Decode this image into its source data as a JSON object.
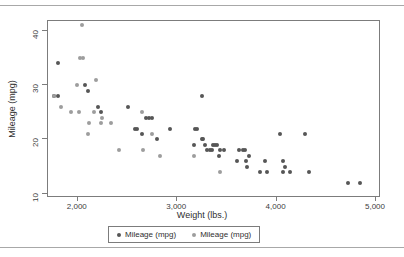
{
  "chart_data": {
    "type": "scatter",
    "title": "",
    "xlabel": "Weight (lbs.)",
    "ylabel": "Mileage (mpg)",
    "xlim": [
      1700,
      5050
    ],
    "ylim": [
      9.2,
      41.8
    ],
    "xticks": [
      2000,
      3000,
      4000,
      5000
    ],
    "xtick_labels": [
      "2,000",
      "3,000",
      "4,000",
      "5,000"
    ],
    "yticks": [
      10,
      20,
      30,
      40
    ],
    "ytick_labels": [
      "10",
      "20",
      "30",
      "40"
    ],
    "grid": false,
    "legend_position": "bottom-center",
    "series": [
      {
        "name": "Mileage (mpg)",
        "color": "#565656",
        "points": [
          [
            1800,
            34
          ],
          [
            1760,
            28
          ],
          [
            1800,
            28
          ],
          [
            2070,
            30
          ],
          [
            2100,
            29
          ],
          [
            2200,
            26
          ],
          [
            2230,
            25
          ],
          [
            2500,
            26
          ],
          [
            2580,
            22
          ],
          [
            2600,
            22
          ],
          [
            2650,
            21
          ],
          [
            2690,
            24
          ],
          [
            2720,
            24
          ],
          [
            2750,
            24
          ],
          [
            2800,
            20
          ],
          [
            2930,
            22
          ],
          [
            3180,
            22
          ],
          [
            3200,
            22
          ],
          [
            3170,
            19
          ],
          [
            3250,
            28
          ],
          [
            3250,
            20
          ],
          [
            3260,
            20
          ],
          [
            3280,
            19
          ],
          [
            3300,
            18
          ],
          [
            3330,
            18
          ],
          [
            3350,
            18
          ],
          [
            3360,
            19
          ],
          [
            3380,
            19
          ],
          [
            3400,
            19
          ],
          [
            3420,
            17
          ],
          [
            3430,
            18
          ],
          [
            3470,
            18
          ],
          [
            3600,
            16
          ],
          [
            3620,
            18
          ],
          [
            3660,
            18
          ],
          [
            3680,
            18
          ],
          [
            3690,
            16
          ],
          [
            3700,
            15
          ],
          [
            3720,
            17
          ],
          [
            3830,
            14
          ],
          [
            3880,
            16
          ],
          [
            3900,
            14
          ],
          [
            4030,
            21
          ],
          [
            4060,
            16
          ],
          [
            4060,
            14
          ],
          [
            4080,
            15
          ],
          [
            4130,
            14
          ],
          [
            4290,
            21
          ],
          [
            4330,
            14
          ],
          [
            4720,
            12
          ],
          [
            4840,
            12
          ]
        ]
      },
      {
        "name": "Mileage (mpg)",
        "color": "#9d9d9d",
        "points": [
          [
            2040,
            41
          ],
          [
            2020,
            35
          ],
          [
            2050,
            35
          ],
          [
            1760,
            28
          ],
          [
            1830,
            26
          ],
          [
            1930,
            25
          ],
          [
            2010,
            25
          ],
          [
            1990,
            30
          ],
          [
            2110,
            23
          ],
          [
            2230,
            23
          ],
          [
            2100,
            21
          ],
          [
            2160,
            25
          ],
          [
            2180,
            31
          ],
          [
            2240,
            24
          ],
          [
            2330,
            23
          ],
          [
            2410,
            18
          ],
          [
            2650,
            25
          ],
          [
            2660,
            18
          ],
          [
            2750,
            21
          ],
          [
            2830,
            17
          ],
          [
            3170,
            17
          ],
          [
            3430,
            14
          ]
        ]
      }
    ]
  },
  "legend": {
    "items": [
      {
        "label": "Mileage (mpg)",
        "color": "#565656"
      },
      {
        "label": "Mileage (mpg)",
        "color": "#9d9d9d"
      }
    ]
  }
}
